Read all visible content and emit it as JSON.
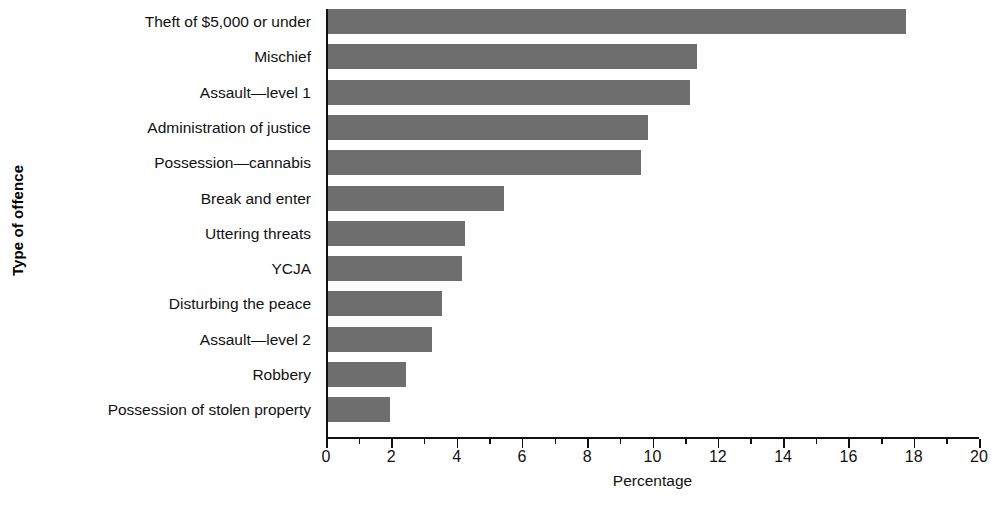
{
  "chart_data": {
    "type": "bar",
    "orientation": "horizontal",
    "title": "",
    "xlabel": "Percentage",
    "ylabel": "Type of offence",
    "xlim": [
      0,
      20
    ],
    "grid": false,
    "legend": null,
    "bar_color": "#6e6e6e",
    "axis_color": "#111111",
    "categories": [
      "Theft of $5,000 or under",
      "Mischief",
      "Assault—level 1",
      "Administration of justice",
      "Possession—cannabis",
      "Break and enter",
      "Uttering threats",
      "YCJA",
      "Disturbing the peace",
      "Assault—level 2",
      "Robbery",
      "Possession of stolen property"
    ],
    "values": [
      17.7,
      11.3,
      11.1,
      9.8,
      9.6,
      5.4,
      4.2,
      4.1,
      3.5,
      3.2,
      2.4,
      1.9
    ],
    "xticks": [
      0,
      1,
      2,
      3,
      4,
      5,
      6,
      7,
      8,
      9,
      10,
      11,
      12,
      13,
      14,
      15,
      16,
      17,
      18,
      19,
      20
    ],
    "xtick_labels": [
      "0",
      "2",
      "4",
      "6",
      "8",
      "10",
      "12",
      "14",
      "16",
      "18",
      "20"
    ],
    "xtick_label_values": [
      0,
      2,
      4,
      6,
      8,
      10,
      12,
      14,
      16,
      18,
      20
    ],
    "minor_tick_values": [
      1,
      3,
      5,
      7,
      9,
      11,
      13,
      15,
      17,
      19
    ]
  }
}
